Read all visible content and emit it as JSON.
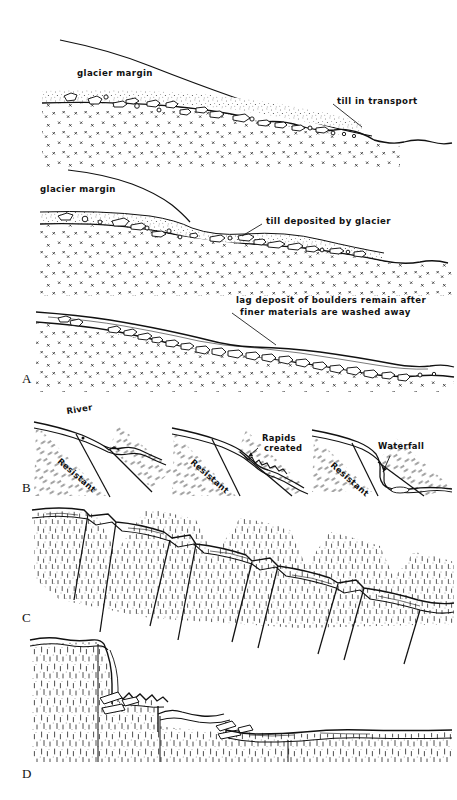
{
  "figure": {
    "kind": "geological-cross-section-plate",
    "panels": [
      {
        "letter": "A",
        "subject": "glacial till deposition and lag deposit formation",
        "stages": [
          {
            "index": 1,
            "labels": [
              {
                "name": "glacier-margin-label-1",
                "text": "glacier margin"
              },
              {
                "name": "till-in-transport-label",
                "text": "till in transport"
              }
            ]
          },
          {
            "index": 2,
            "labels": [
              {
                "name": "glacier-margin-label-2",
                "text": "glacier margin"
              },
              {
                "name": "till-deposited-label",
                "text": "till deposited by glacier"
              }
            ]
          },
          {
            "index": 3,
            "labels": [
              {
                "name": "lag-deposit-label-line-1",
                "text": "lag deposit of boulders remain after"
              },
              {
                "name": "lag-deposit-label-line-2",
                "text": "finer materials are washed away"
              }
            ]
          }
        ]
      },
      {
        "letter": "B",
        "subject": "resistant bed exposure creating rapids then a waterfall",
        "stages": [
          {
            "index": 1,
            "labels": [
              {
                "name": "river-label",
                "text": "River"
              },
              {
                "name": "resistant-label-1",
                "text": "Resistant"
              }
            ]
          },
          {
            "index": 2,
            "labels": [
              {
                "name": "rapids-label-line-1",
                "text": "Rapids"
              },
              {
                "name": "rapids-label-line-2",
                "text": "created"
              },
              {
                "name": "resistant-label-2",
                "text": "Resistant"
              }
            ]
          },
          {
            "index": 3,
            "labels": [
              {
                "name": "waterfall-label",
                "text": "Waterfall"
              },
              {
                "name": "resistant-label-3",
                "text": "Resistant"
              }
            ]
          }
        ]
      },
      {
        "letter": "C",
        "subject": "stepped normal fault blocks in dashed-texture rock",
        "stages": [],
        "labels": []
      },
      {
        "letter": "D",
        "subject": "vertical cliff retreat with talus blocks",
        "stages": [],
        "labels": []
      }
    ],
    "colors": {
      "ink": "#111111",
      "paper": "#ffffff",
      "stipple": "#333333"
    }
  }
}
